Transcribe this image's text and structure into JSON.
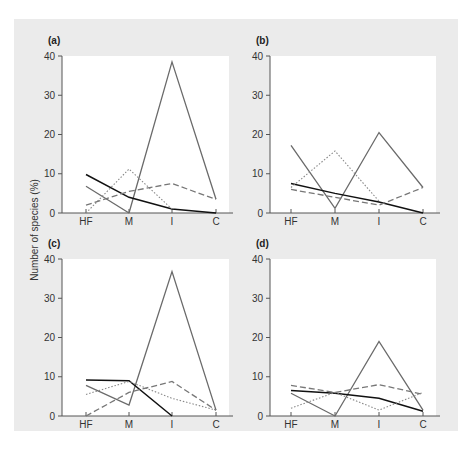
{
  "figure": {
    "ylabel": "Number of species (%)",
    "colors": {
      "frame_bg": "#ebebeb",
      "plot_bg": "#ffffff",
      "axis": "#555555"
    }
  },
  "chart_data": [
    {
      "panel": "(a)",
      "type": "line",
      "categories": [
        "HF",
        "M",
        "I",
        "C"
      ],
      "ylim": [
        0,
        40
      ],
      "yticks": [
        0,
        10,
        20,
        30,
        40
      ],
      "ylabel": "Number of species (%)",
      "series": [
        {
          "name": "solid-gray",
          "style": "solid-gray",
          "values": [
            null,
            0,
            38.5,
            3.5
          ]
        },
        {
          "name": "solid-gray-b",
          "style": "solid-gray",
          "values": [
            6.8,
            0,
            null,
            null
          ]
        },
        {
          "name": "solid-black",
          "style": "solid-black",
          "values": [
            9.8,
            4.0,
            1.0,
            0
          ]
        },
        {
          "name": "dotted",
          "style": "dotted",
          "values": [
            0,
            11.2,
            1.0,
            null
          ]
        },
        {
          "name": "dashed",
          "style": "dashed",
          "values": [
            2.0,
            5.5,
            7.5,
            3.5
          ]
        }
      ]
    },
    {
      "panel": "(b)",
      "type": "line",
      "categories": [
        "HF",
        "M",
        "I",
        "C"
      ],
      "ylim": [
        0,
        40
      ],
      "yticks": [
        0,
        10,
        20,
        30,
        40
      ],
      "series": [
        {
          "name": "solid-gray",
          "style": "solid-gray",
          "values": [
            17.2,
            1.2,
            20.5,
            6.5
          ]
        },
        {
          "name": "solid-black",
          "style": "solid-black",
          "values": [
            7.5,
            5.0,
            2.8,
            0
          ]
        },
        {
          "name": "dotted",
          "style": "dotted",
          "values": [
            6.5,
            15.8,
            3.0,
            null
          ]
        },
        {
          "name": "dashed",
          "style": "dashed",
          "values": [
            6.0,
            4.0,
            2.0,
            6.5
          ]
        }
      ]
    },
    {
      "panel": "(c)",
      "type": "line",
      "categories": [
        "HF",
        "M",
        "I",
        "C"
      ],
      "ylim": [
        0,
        40
      ],
      "yticks": [
        0,
        10,
        20,
        30,
        40
      ],
      "series": [
        {
          "name": "solid-gray",
          "style": "solid-gray",
          "values": [
            7.8,
            2.8,
            36.8,
            1.5
          ]
        },
        {
          "name": "solid-black",
          "style": "solid-black",
          "values": [
            9.2,
            9.0,
            0,
            null
          ]
        },
        {
          "name": "dotted",
          "style": "dotted",
          "values": [
            5.5,
            8.8,
            4.5,
            1.5
          ]
        },
        {
          "name": "dashed",
          "style": "dashed",
          "values": [
            0,
            6.0,
            8.8,
            1.5
          ]
        }
      ]
    },
    {
      "panel": "(d)",
      "type": "line",
      "categories": [
        "HF",
        "M",
        "I",
        "C"
      ],
      "ylim": [
        0,
        40
      ],
      "yticks": [
        0,
        10,
        20,
        30,
        40
      ],
      "series": [
        {
          "name": "solid-gray",
          "style": "solid-gray",
          "values": [
            5.8,
            0,
            19.0,
            1.5
          ]
        },
        {
          "name": "solid-black",
          "style": "solid-black",
          "values": [
            6.5,
            5.8,
            4.5,
            1.2
          ]
        },
        {
          "name": "dotted",
          "style": "dotted",
          "values": [
            2.0,
            6.0,
            1.5,
            6.0
          ]
        },
        {
          "name": "dashed",
          "style": "dashed",
          "values": [
            7.8,
            6.0,
            8.0,
            5.5
          ]
        }
      ]
    }
  ]
}
